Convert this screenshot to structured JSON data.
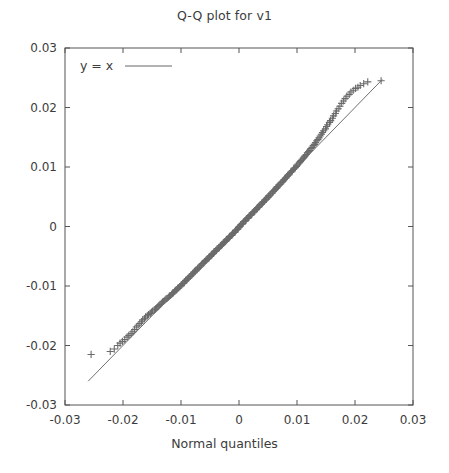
{
  "chart_data": {
    "type": "scatter",
    "title": "Q-Q plot for v1",
    "xlabel": "Normal quantiles",
    "ylabel": "",
    "xlim": [
      -0.03,
      0.03
    ],
    "ylim": [
      -0.03,
      0.03
    ],
    "grid": false,
    "legend_position": "top-left",
    "legend": [
      {
        "label": "y = x",
        "marker": "line",
        "color": "#666666"
      }
    ],
    "series": [
      {
        "name": "sample quantiles",
        "marker": "plus",
        "color": "#6b6b6b",
        "x": [
          -0.0255,
          -0.0222,
          -0.0215,
          -0.0209,
          -0.0205,
          -0.0201,
          -0.0197,
          -0.0193,
          -0.019,
          -0.0186,
          -0.0183,
          -0.018,
          -0.0177,
          -0.0174,
          -0.0171,
          -0.0168,
          -0.0166,
          -0.0163,
          -0.0161,
          -0.0158,
          -0.0156,
          -0.0153,
          -0.0151,
          -0.0149,
          -0.0146,
          -0.0144,
          -0.0142,
          -0.014,
          -0.0138,
          -0.0136,
          -0.0134,
          -0.0132,
          -0.013,
          -0.0128,
          -0.0126,
          -0.0124,
          -0.0122,
          -0.012,
          -0.0118,
          -0.0116,
          -0.0114,
          -0.0113,
          -0.0111,
          -0.0109,
          -0.0107,
          -0.0106,
          -0.0104,
          -0.0102,
          -0.01,
          -0.0099,
          -0.0097,
          -0.0095,
          -0.0094,
          -0.0092,
          -0.0091,
          -0.0089,
          -0.0087,
          -0.0086,
          -0.0084,
          -0.0083,
          -0.0081,
          -0.008,
          -0.0078,
          -0.0077,
          -0.0075,
          -0.0074,
          -0.0072,
          -0.0071,
          -0.0069,
          -0.0068,
          -0.0066,
          -0.0065,
          -0.0064,
          -0.0062,
          -0.0061,
          -0.0059,
          -0.0058,
          -0.0057,
          -0.0055,
          -0.0054,
          -0.0052,
          -0.0051,
          -0.005,
          -0.0048,
          -0.0047,
          -0.0046,
          -0.0044,
          -0.0043,
          -0.0042,
          -0.004,
          -0.0039,
          -0.0038,
          -0.0036,
          -0.0035,
          -0.0034,
          -0.0032,
          -0.0031,
          -0.003,
          -0.0029,
          -0.0027,
          -0.0026,
          -0.0025,
          -0.0023,
          -0.0022,
          -0.0021,
          -0.002,
          -0.0018,
          -0.0017,
          -0.0016,
          -0.0015,
          -0.0013,
          -0.0012,
          -0.0011,
          -0.001,
          -0.0008,
          -0.0007,
          -0.0006,
          -0.0005,
          -0.0003,
          -0.0002,
          -0.0001,
          0.0,
          0.0001,
          0.0002,
          0.0003,
          0.0005,
          0.0006,
          0.0007,
          0.0008,
          0.001,
          0.0011,
          0.0012,
          0.0013,
          0.0015,
          0.0016,
          0.0017,
          0.0018,
          0.002,
          0.0021,
          0.0022,
          0.0023,
          0.0025,
          0.0026,
          0.0027,
          0.0029,
          0.003,
          0.0031,
          0.0032,
          0.0034,
          0.0035,
          0.0036,
          0.0038,
          0.0039,
          0.004,
          0.0042,
          0.0043,
          0.0044,
          0.0046,
          0.0047,
          0.0048,
          0.005,
          0.0051,
          0.0052,
          0.0054,
          0.0055,
          0.0057,
          0.0058,
          0.0059,
          0.0061,
          0.0062,
          0.0064,
          0.0065,
          0.0066,
          0.0068,
          0.0069,
          0.0071,
          0.0072,
          0.0074,
          0.0075,
          0.0077,
          0.0078,
          0.008,
          0.0081,
          0.0083,
          0.0084,
          0.0086,
          0.0087,
          0.0089,
          0.0091,
          0.0092,
          0.0094,
          0.0095,
          0.0097,
          0.0099,
          0.01,
          0.0102,
          0.0104,
          0.0106,
          0.0107,
          0.0109,
          0.0111,
          0.0113,
          0.0114,
          0.0116,
          0.0118,
          0.012,
          0.0122,
          0.0124,
          0.0126,
          0.0128,
          0.013,
          0.0132,
          0.0134,
          0.0136,
          0.0138,
          0.014,
          0.0142,
          0.0144,
          0.0146,
          0.0149,
          0.0151,
          0.0153,
          0.0156,
          0.0158,
          0.0161,
          0.0163,
          0.0166,
          0.0168,
          0.0171,
          0.0174,
          0.0177,
          0.018,
          0.0183,
          0.0186,
          0.019,
          0.0193,
          0.0197,
          0.0201,
          0.0205,
          0.0209,
          0.0215,
          0.0222,
          0.0245
        ],
        "y": [
          -0.0215,
          -0.021,
          -0.0206,
          -0.02,
          -0.0196,
          -0.0193,
          -0.019,
          -0.0186,
          -0.0183,
          -0.018,
          -0.0177,
          -0.0173,
          -0.0169,
          -0.0166,
          -0.0163,
          -0.016,
          -0.0157,
          -0.0155,
          -0.0152,
          -0.015,
          -0.0148,
          -0.0146,
          -0.0144,
          -0.0142,
          -0.014,
          -0.0139,
          -0.0137,
          -0.0135,
          -0.0133,
          -0.0131,
          -0.0129,
          -0.0127,
          -0.0126,
          -0.0124,
          -0.0122,
          -0.0121,
          -0.0119,
          -0.0117,
          -0.0116,
          -0.0114,
          -0.0112,
          -0.0111,
          -0.0109,
          -0.0107,
          -0.0106,
          -0.0104,
          -0.0103,
          -0.0101,
          -0.0099,
          -0.0098,
          -0.0096,
          -0.0095,
          -0.0093,
          -0.0091,
          -0.009,
          -0.0088,
          -0.0087,
          -0.0085,
          -0.0084,
          -0.0082,
          -0.0081,
          -0.0079,
          -0.0078,
          -0.0076,
          -0.0075,
          -0.0073,
          -0.0072,
          -0.007,
          -0.0069,
          -0.0068,
          -0.0066,
          -0.0065,
          -0.0063,
          -0.0062,
          -0.0061,
          -0.0059,
          -0.0058,
          -0.0057,
          -0.0055,
          -0.0054,
          -0.0053,
          -0.0051,
          -0.005,
          -0.0049,
          -0.0047,
          -0.0046,
          -0.0045,
          -0.0043,
          -0.0042,
          -0.0041,
          -0.004,
          -0.0038,
          -0.0037,
          -0.0036,
          -0.0035,
          -0.0033,
          -0.0032,
          -0.0031,
          -0.003,
          -0.0028,
          -0.0027,
          -0.0026,
          -0.0025,
          -0.0023,
          -0.0022,
          -0.0021,
          -0.002,
          -0.0018,
          -0.0017,
          -0.0016,
          -0.0015,
          -0.0014,
          -0.0012,
          -0.0011,
          -0.001,
          -0.0009,
          -0.0007,
          -0.0006,
          -0.0005,
          -0.0004,
          -0.0002,
          -0.0001,
          0.0,
          0.0001,
          0.0003,
          0.0004,
          0.0005,
          0.0006,
          0.0008,
          0.0009,
          0.001,
          0.0011,
          0.0013,
          0.0014,
          0.0015,
          0.0016,
          0.0018,
          0.0019,
          0.002,
          0.0021,
          0.0023,
          0.0024,
          0.0025,
          0.0026,
          0.0028,
          0.0029,
          0.003,
          0.0032,
          0.0033,
          0.0034,
          0.0036,
          0.0037,
          0.0038,
          0.004,
          0.0041,
          0.0042,
          0.0044,
          0.0045,
          0.0046,
          0.0048,
          0.0049,
          0.0051,
          0.0052,
          0.0053,
          0.0055,
          0.0056,
          0.0058,
          0.0059,
          0.0061,
          0.0062,
          0.0064,
          0.0065,
          0.0067,
          0.0068,
          0.007,
          0.0071,
          0.0073,
          0.0074,
          0.0076,
          0.0077,
          0.0079,
          0.0081,
          0.0082,
          0.0084,
          0.0086,
          0.0087,
          0.0089,
          0.0091,
          0.0092,
          0.0094,
          0.0096,
          0.0098,
          0.0099,
          0.0101,
          0.0103,
          0.0105,
          0.0107,
          0.0109,
          0.0111,
          0.0113,
          0.0115,
          0.0117,
          0.0119,
          0.0121,
          0.0124,
          0.0126,
          0.0128,
          0.0131,
          0.0133,
          0.0136,
          0.0138,
          0.0141,
          0.0144,
          0.0146,
          0.0149,
          0.0152,
          0.0155,
          0.0158,
          0.0161,
          0.0164,
          0.0168,
          0.0171,
          0.0175,
          0.0178,
          0.0182,
          0.0186,
          0.019,
          0.0194,
          0.0198,
          0.0202,
          0.0207,
          0.0211,
          0.0215,
          0.0219,
          0.0222,
          0.0226,
          0.0229,
          0.0232,
          0.0234,
          0.0237,
          0.024,
          0.0243,
          0.0245
        ]
      }
    ],
    "reference_line": {
      "name": "y = x",
      "x": [
        -0.026,
        0.0247
      ],
      "y": [
        -0.026,
        0.0247
      ],
      "color": "#707070"
    },
    "xticks": [
      "-0.03",
      "-0.02",
      "-0.01",
      "0",
      "0.01",
      "0.02",
      "0.03"
    ],
    "xtick_values": [
      -0.03,
      -0.02,
      -0.01,
      0,
      0.01,
      0.02,
      0.03
    ],
    "yticks": [
      "0.03",
      "0.02",
      "0.01",
      "0",
      "-0.01",
      "-0.02",
      "-0.03"
    ],
    "ytick_values": [
      0.03,
      0.02,
      0.01,
      0,
      -0.01,
      -0.02,
      -0.03
    ]
  },
  "legend_label": "y = x"
}
